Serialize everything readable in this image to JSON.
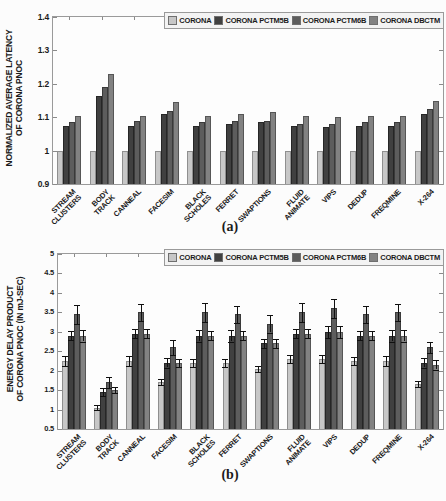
{
  "chart_data": [
    {
      "id": "a",
      "type": "bar",
      "caption": "(a)",
      "ylabel_line1": "NORMALIZED AVERAGE LATENCY",
      "ylabel_line2": "OF CORONA PNOC",
      "ylim": [
        0.9,
        1.4
      ],
      "yticks": [
        0.9,
        1.0,
        1.1,
        1.2,
        1.3,
        1.4
      ],
      "ytick_labels": [
        "0.9",
        "1",
        "1.1",
        "1.2",
        "1.3",
        "1.4"
      ],
      "grid": false,
      "legend_position": "top-right-inside",
      "error_bars": false,
      "categories": [
        [
          "STREAM",
          "CLUSTERS"
        ],
        [
          "BODY",
          "TRACK"
        ],
        [
          "CANNEAL"
        ],
        [
          "FACESIM"
        ],
        [
          "BLACK",
          "SCHOLES"
        ],
        [
          "FERRET"
        ],
        [
          "SWAPTIONS"
        ],
        [
          "FLUID",
          "ANIMATE"
        ],
        [
          "VIPS"
        ],
        [
          "DEDUP"
        ],
        [
          "FREQMINE"
        ],
        [
          "X-264"
        ]
      ],
      "series": [
        {
          "name": "CORONA",
          "color": "#c7c7c7",
          "edge": "#8f8f8f",
          "values": [
            1.0,
            1.0,
            1.0,
            1.0,
            1.0,
            1.0,
            1.0,
            1.0,
            1.0,
            1.0,
            1.0,
            1.0
          ]
        },
        {
          "name": "CORONA PCTM5B",
          "color": "#404040",
          "edge": "#262626",
          "values": [
            1.075,
            1.165,
            1.075,
            1.11,
            1.075,
            1.08,
            1.085,
            1.075,
            1.07,
            1.075,
            1.075,
            1.11
          ]
        },
        {
          "name": "CORONA PCTM6B",
          "color": "#5d5d5d",
          "edge": "#3a3a3a",
          "values": [
            1.085,
            1.19,
            1.09,
            1.12,
            1.085,
            1.09,
            1.09,
            1.08,
            1.08,
            1.085,
            1.085,
            1.125
          ]
        },
        {
          "name": "CORONA DBCTM",
          "color": "#828282",
          "edge": "#565656",
          "values": [
            1.105,
            1.23,
            1.105,
            1.145,
            1.105,
            1.11,
            1.115,
            1.105,
            1.1,
            1.105,
            1.105,
            1.15
          ]
        }
      ]
    },
    {
      "id": "b",
      "type": "bar",
      "caption": "(b)",
      "ylabel_line1": "ENERGY DELAY PRODUCT",
      "ylabel_line2": "OF CORONA PNOC (IN mJ-SEC)",
      "ylim": [
        0.5,
        5.0
      ],
      "yticks": [
        0.5,
        1.0,
        1.5,
        2.0,
        2.5,
        3.0,
        3.5,
        4.0,
        4.5,
        5.0
      ],
      "ytick_labels": [
        "0.5",
        "1",
        "1.5",
        "2",
        "2.5",
        "3",
        "3.5",
        "4",
        "4.5",
        "5"
      ],
      "grid": false,
      "legend_position": "top-right-inside",
      "error_bars": true,
      "categories": [
        [
          "STREAM",
          "CLUSTERS"
        ],
        [
          "BODY",
          "TRACK"
        ],
        [
          "CANNEAL"
        ],
        [
          "FACESIM"
        ],
        [
          "BLACK",
          "SCHOLES"
        ],
        [
          "FERRET"
        ],
        [
          "SWAPTIONS"
        ],
        [
          "FLUID",
          "ANIMATE"
        ],
        [
          "VIPS"
        ],
        [
          "DEDUP"
        ],
        [
          "FREQMINE"
        ],
        [
          "X-264"
        ]
      ],
      "series": [
        {
          "name": "CORONA",
          "color": "#c7c7c7",
          "edge": "#8f8f8f",
          "values": [
            2.25,
            1.05,
            2.25,
            1.7,
            2.2,
            2.2,
            2.05,
            2.3,
            2.3,
            2.25,
            2.25,
            1.65
          ],
          "errors": [
            0.12,
            0.07,
            0.12,
            0.08,
            0.1,
            0.1,
            0.08,
            0.1,
            0.1,
            0.1,
            0.12,
            0.08
          ]
        },
        {
          "name": "CORONA PCTM5B",
          "color": "#404040",
          "edge": "#262626",
          "values": [
            2.9,
            1.45,
            2.95,
            2.2,
            2.9,
            2.9,
            2.7,
            2.95,
            3.0,
            2.9,
            2.9,
            2.2
          ],
          "errors": [
            0.12,
            0.1,
            0.12,
            0.12,
            0.15,
            0.15,
            0.12,
            0.12,
            0.15,
            0.12,
            0.15,
            0.12
          ]
        },
        {
          "name": "CORONA PCTM6B",
          "color": "#5d5d5d",
          "edge": "#3a3a3a",
          "values": [
            3.45,
            1.7,
            3.5,
            2.6,
            3.5,
            3.45,
            3.2,
            3.5,
            3.6,
            3.45,
            3.5,
            2.6
          ],
          "errors": [
            0.25,
            0.15,
            0.22,
            0.2,
            0.25,
            0.22,
            0.22,
            0.25,
            0.25,
            0.22,
            0.22,
            0.15
          ]
        },
        {
          "name": "CORONA DBCTM",
          "color": "#828282",
          "edge": "#565656",
          "values": [
            2.9,
            1.5,
            2.95,
            2.2,
            2.9,
            2.9,
            2.7,
            2.95,
            3.0,
            2.9,
            2.9,
            2.15
          ],
          "errors": [
            0.15,
            0.08,
            0.12,
            0.1,
            0.12,
            0.12,
            0.12,
            0.12,
            0.15,
            0.12,
            0.15,
            0.12
          ]
        }
      ]
    }
  ]
}
